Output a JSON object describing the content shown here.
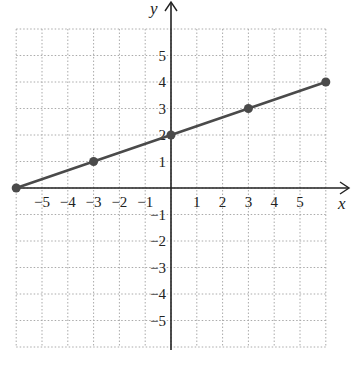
{
  "chart_data": {
    "type": "line",
    "title": "",
    "xlabel": "x",
    "ylabel": "y",
    "xlim": [
      -6,
      6
    ],
    "ylim": [
      -6,
      6
    ],
    "grid": true,
    "x_tick_labels": [
      "-5",
      "-4",
      "-3",
      "-2",
      "-1",
      "1",
      "2",
      "3",
      "4",
      "5"
    ],
    "y_tick_labels": [
      "5",
      "4",
      "3",
      "2",
      "1",
      "-1",
      "-2",
      "-3",
      "-4",
      "-5"
    ],
    "series": [
      {
        "name": "line",
        "points": [
          [
            -6,
            0
          ],
          [
            -3,
            1
          ],
          [
            0,
            2
          ],
          [
            3,
            3
          ],
          [
            6,
            4
          ]
        ],
        "color": "#4a4a4a"
      }
    ]
  },
  "labels": {
    "x_axis": "x",
    "y_axis": "y"
  }
}
